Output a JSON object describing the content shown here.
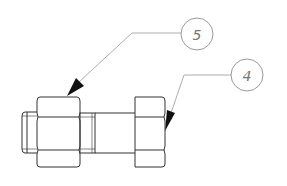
{
  "drawing": {
    "type": "assembly-detail",
    "subject": "bolt with two hex nuts",
    "line_color": "#333333",
    "leader_color": "#888888",
    "balloon_color": "#999999",
    "background": "#ffffff"
  },
  "callouts": [
    {
      "number": "5",
      "target": "left-hex-nut"
    },
    {
      "number": "4",
      "target": "right-hex-nut"
    }
  ]
}
